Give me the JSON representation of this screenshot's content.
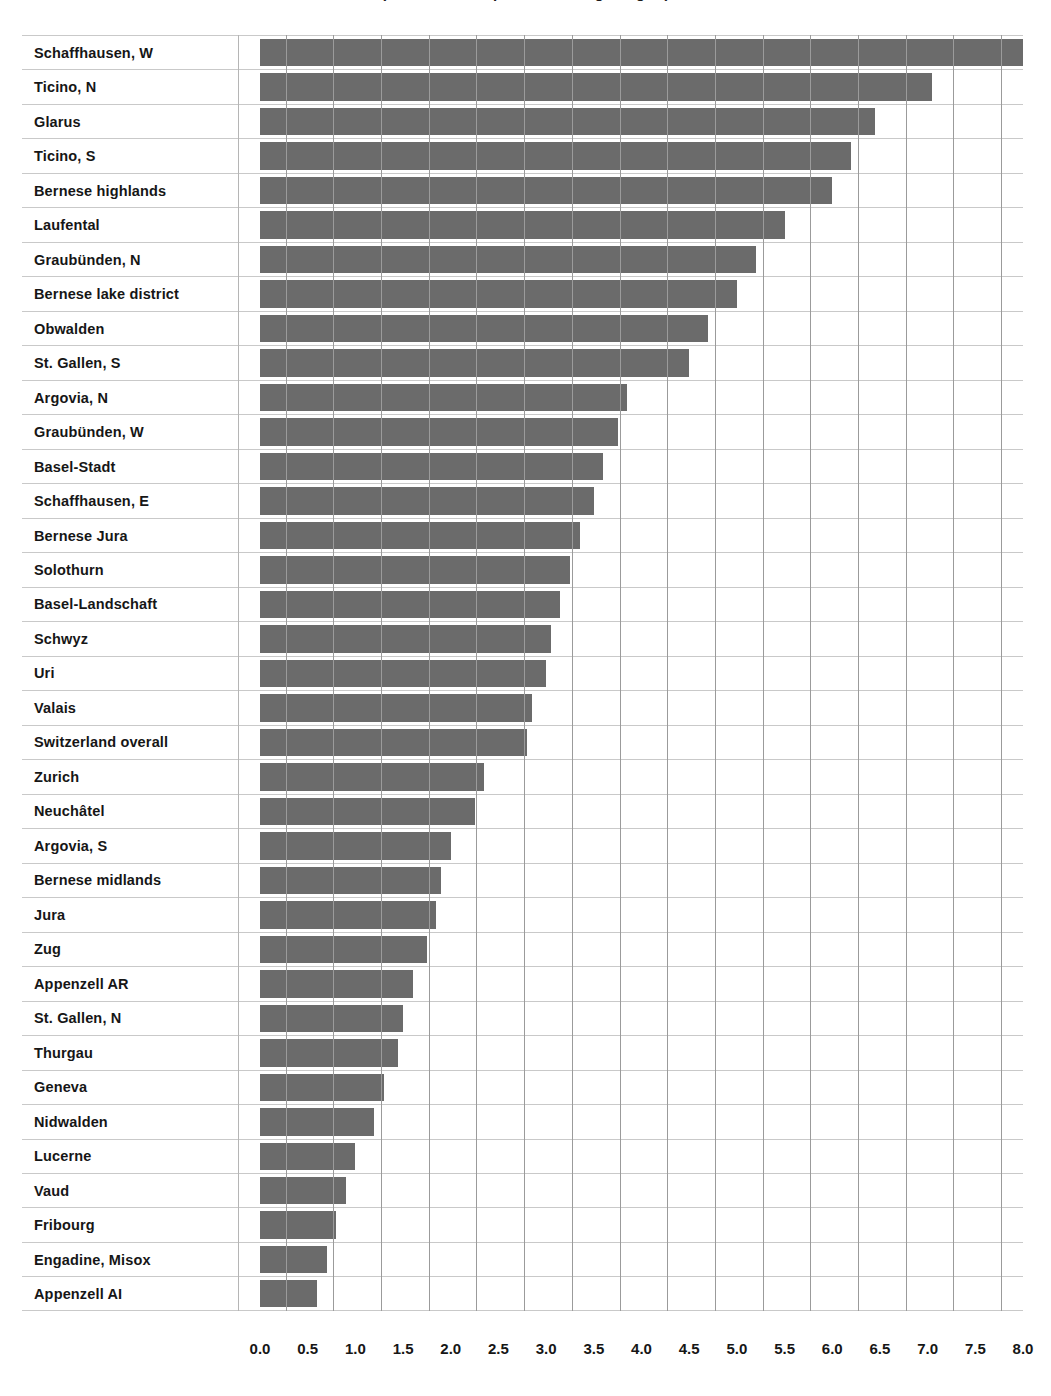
{
  "chart_data": {
    "type": "bar",
    "orientation": "horizontal",
    "title": "(incidence rate per 100 000 regular grid)",
    "xlabel": "",
    "ylabel": "",
    "xlim": [
      0.0,
      8.0
    ],
    "grid": true,
    "legend": "none",
    "bar_color": "#6b6b6b",
    "gridline_color": "#9b9b9b",
    "tick_step": 0.5,
    "tick_labels": [
      "0.0",
      "0.5",
      "1.0",
      "1.5",
      "2.0",
      "2.5",
      "3.0",
      "3.5",
      "4.0",
      "4.5",
      "5.0",
      "5.5",
      "6.0",
      "6.5",
      "7.0",
      "7.5",
      "8.0"
    ],
    "tick_values": [
      0.0,
      0.5,
      1.0,
      1.5,
      2.0,
      2.5,
      3.0,
      3.5,
      4.0,
      4.5,
      5.0,
      5.5,
      6.0,
      6.5,
      7.0,
      7.5,
      8.0
    ],
    "categories": [
      "Schaffhausen, W",
      "Ticino, N",
      "Glarus",
      "Ticino, S",
      "Bernese highlands",
      "Laufental",
      "Graubünden, N",
      "Bernese lake district",
      "Obwalden",
      "St. Gallen, S",
      "Argovia, N",
      "Graubünden, W",
      "Basel-Stadt",
      "Schaffhausen, E",
      "Bernese Jura",
      "Solothurn",
      "Basel-Landschaft",
      "Schwyz",
      "Uri",
      "Valais",
      "Switzerland overall",
      "Zurich",
      "Neuchâtel",
      "Argovia, S",
      "Bernese midlands",
      "Jura",
      "Zug",
      "Appenzell AR",
      "St. Gallen, N",
      "Thurgau",
      "Geneva",
      "Nidwalden",
      "Lucerne",
      "Vaud",
      "Fribourg",
      "Engadine, Misox",
      "Appenzell AI"
    ],
    "values": [
      8.0,
      7.05,
      6.45,
      6.2,
      6.0,
      5.5,
      5.2,
      5.0,
      4.7,
      4.5,
      3.85,
      3.75,
      3.6,
      3.5,
      3.35,
      3.25,
      3.15,
      3.05,
      3.0,
      2.85,
      2.8,
      2.35,
      2.25,
      2.0,
      1.9,
      1.85,
      1.75,
      1.6,
      1.5,
      1.45,
      1.3,
      1.2,
      1.0,
      0.9,
      0.8,
      0.7,
      0.6
    ]
  }
}
